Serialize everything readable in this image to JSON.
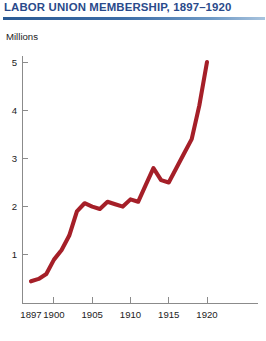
{
  "header": {
    "title": "LABOR UNION MEMBERSHIP, 1897–1920",
    "title_color": "#2a4a8b",
    "rule_color": "#2a5a94"
  },
  "chart_data": {
    "type": "line",
    "title": "LABOR UNION MEMBERSHIP, 1897–1920",
    "subtitle": "",
    "xlabel": "",
    "ylabel": "Millions",
    "axis_unit_label": "Millions",
    "line_color": "#a51f28",
    "grid": false,
    "legend": false,
    "legend_position": "none",
    "xlim": [
      1897,
      1920
    ],
    "ylim": [
      0,
      5
    ],
    "y_ticks": [
      1,
      2,
      3,
      4,
      5
    ],
    "y_tick_labels": [
      "1",
      "2",
      "3",
      "4",
      "5"
    ],
    "x_ticks": [
      1897,
      1900,
      1905,
      1910,
      1915,
      1920
    ],
    "x_tick_labels": [
      "1897",
      "1900",
      "1905",
      "1910",
      "1915",
      "1920"
    ],
    "x": [
      1897,
      1898,
      1899,
      1900,
      1901,
      1902,
      1903,
      1904,
      1905,
      1906,
      1907,
      1908,
      1909,
      1910,
      1911,
      1912,
      1913,
      1914,
      1915,
      1916,
      1917,
      1918,
      1919,
      1920
    ],
    "values": [
      0.45,
      0.5,
      0.6,
      0.9,
      1.1,
      1.4,
      1.9,
      2.07,
      2.0,
      1.95,
      2.1,
      2.05,
      2.0,
      2.15,
      2.1,
      2.45,
      2.8,
      2.55,
      2.5,
      2.8,
      3.1,
      3.4,
      4.1,
      5.0
    ],
    "series": [
      {
        "name": "Union membership (millions)",
        "color": "#a51f28",
        "values": [
          0.45,
          0.5,
          0.6,
          0.9,
          1.1,
          1.4,
          1.9,
          2.07,
          2.0,
          1.95,
          2.1,
          2.05,
          2.0,
          2.15,
          2.1,
          2.45,
          2.8,
          2.55,
          2.5,
          2.8,
          3.1,
          3.4,
          4.1,
          5.0
        ]
      }
    ]
  }
}
